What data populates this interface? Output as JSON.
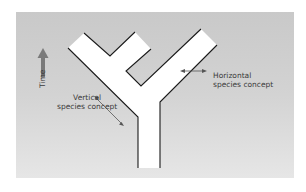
{
  "diagram": {
    "title": "",
    "time_axis": {
      "label": "Time",
      "direction": "up",
      "arrow_color": "#7a7a7a"
    },
    "labels": {
      "horizontal_line1": "Horizontal",
      "horizontal_line2": "species concept",
      "vertical_line1": "Vertical",
      "vertical_line2": "species concept"
    },
    "colors": {
      "background_top": "#c9c9c9",
      "background_bottom": "#e6e6e6",
      "tree_fill": "#ffffff",
      "tree_outline": "#1a1a1a",
      "arrow_color": "#555555",
      "text_color": "#3a3a3a"
    },
    "nodes": [
      {
        "id": "trunk",
        "label": "ancestral lineage"
      },
      {
        "id": "left-branch",
        "label": "descendant lineage (left)"
      },
      {
        "id": "left-sub-branch",
        "label": "short side lineage"
      },
      {
        "id": "right-branch",
        "label": "descendant lineage (right)"
      }
    ]
  }
}
